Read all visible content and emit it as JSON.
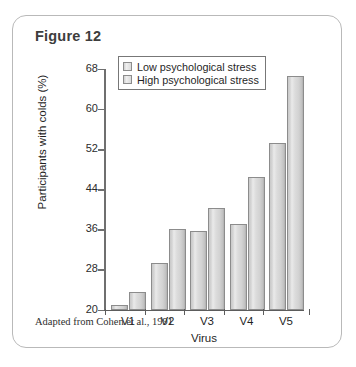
{
  "figure": {
    "title": "Figure 12",
    "caption": "Adapted from Cohen et al., 1991"
  },
  "legend": {
    "position": "top-left-inside",
    "items": [
      {
        "label": "Low psychological stress",
        "swatch_name": "legend-swatch-low-stress"
      },
      {
        "label": "High psychological stress",
        "swatch_name": "legend-swatch-high-stress"
      }
    ]
  },
  "chart_data": {
    "type": "bar",
    "title": "Figure 12",
    "xlabel": "Virus",
    "ylabel": "Participants with colds (%)",
    "categories": [
      "V1",
      "V2",
      "V3",
      "V4",
      "V5"
    ],
    "series": [
      {
        "name": "Low psychological stress",
        "values": [
          20.9,
          29.3,
          35.6,
          37.1,
          53.2
        ]
      },
      {
        "name": "High psychological stress",
        "values": [
          23.4,
          36.1,
          40.3,
          46.4,
          66.6
        ]
      }
    ],
    "ylim": [
      20,
      68
    ],
    "yticks": [
      20,
      28,
      36,
      44,
      52,
      60,
      68
    ],
    "ytick_labels": [
      "20",
      "28",
      "36",
      "44",
      "52",
      "60",
      "68"
    ],
    "grid": false,
    "bar_fill_color": "#dcdcdc",
    "bar_border_color": "#8c8c8c"
  }
}
